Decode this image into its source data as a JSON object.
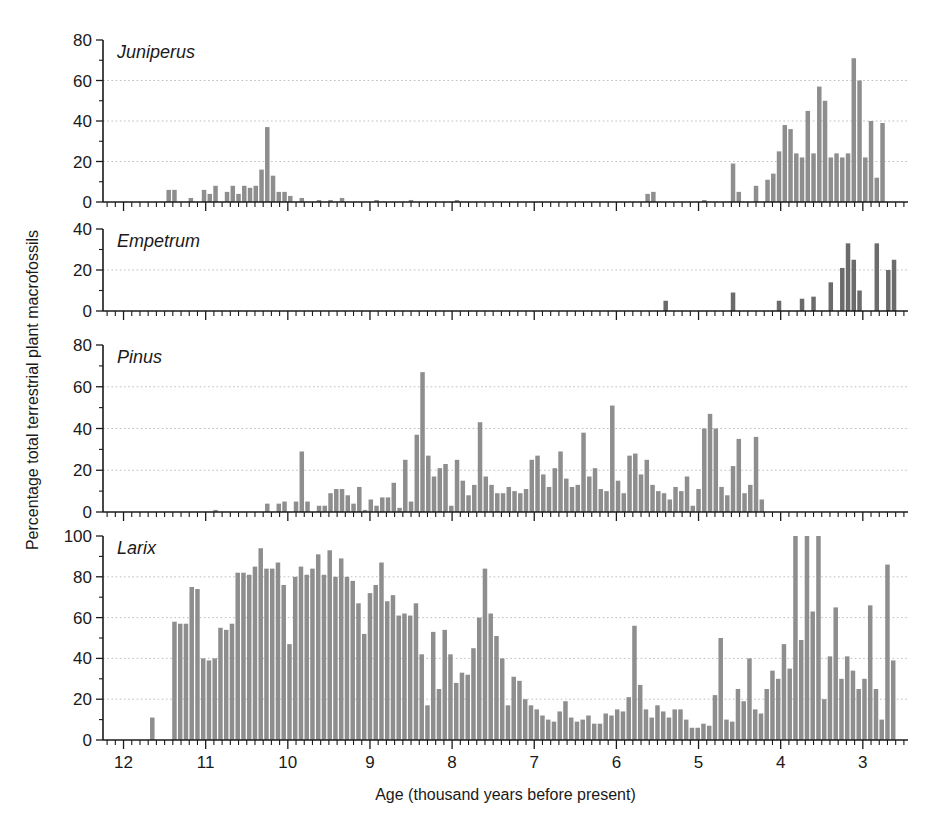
{
  "figure": {
    "xaxis_title": "Age (thousand years before present)",
    "yaxis_title": "Percentage total terrestrial plant macrofossils",
    "x_ticks": [
      "12",
      "11",
      "10",
      "9",
      "8",
      "7",
      "6",
      "5",
      "4",
      "3"
    ],
    "x_tick_values": [
      12,
      11,
      10,
      9,
      8,
      7,
      6,
      5,
      4,
      3
    ],
    "x_range": [
      12.25,
      2.45
    ],
    "bar_color": "#8e8e8e",
    "bar_color_dark": "#6b6b6b",
    "grid_color": "#b8b8b8",
    "axis_color": "#1a1a1a"
  },
  "chart_data": [
    {
      "type": "bar",
      "title": "Juniperus",
      "panel": 0,
      "xlabel": "Age (thousand years before present)",
      "ylabel": "Percentage total terrestrial plant macrofossils",
      "ylim": [
        0,
        80
      ],
      "y_ticks": [
        0,
        20,
        40,
        60,
        80
      ],
      "y_minor_step": 10,
      "xlim": [
        12.25,
        2.45
      ],
      "grid": true,
      "color": "#8e8e8e",
      "x": [
        11.45,
        11.38,
        11.31,
        11.18,
        11.02,
        10.95,
        10.88,
        10.74,
        10.67,
        10.6,
        10.53,
        10.46,
        10.39,
        10.32,
        10.25,
        10.18,
        10.11,
        10.04,
        9.97,
        9.9,
        9.83,
        9.76,
        9.69,
        9.62,
        9.55,
        9.48,
        9.41,
        9.34,
        9.2,
        9.06,
        8.92,
        8.78,
        8.5,
        8.22,
        7.94,
        5.62,
        5.55,
        5.0,
        4.93,
        4.58,
        4.51,
        4.37,
        4.3,
        4.16,
        4.09,
        4.02,
        3.95,
        3.88,
        3.81,
        3.74,
        3.67,
        3.6,
        3.53,
        3.46,
        3.39,
        3.32,
        3.25,
        3.18,
        3.11,
        3.04,
        2.97,
        2.9,
        2.83,
        2.76,
        2.69,
        2.62
      ],
      "values": [
        6,
        6,
        0,
        2,
        6,
        4,
        8,
        5,
        8,
        4,
        8,
        7,
        8,
        16,
        37,
        13,
        5,
        5,
        3,
        0,
        2,
        0,
        0,
        1,
        0,
        1,
        0,
        2,
        0,
        0,
        1,
        0,
        1,
        0,
        1,
        4,
        5,
        0,
        1,
        19,
        5,
        0,
        8,
        11,
        14,
        25,
        38,
        36,
        24,
        22,
        45,
        24,
        57,
        50,
        22,
        24,
        22,
        24,
        71,
        60,
        22,
        40,
        12,
        39,
        0,
        0
      ]
    },
    {
      "type": "bar",
      "title": "Empetrum",
      "panel": 1,
      "xlabel": "Age (thousand years before present)",
      "ylabel": "Percentage total terrestrial plant macrofossils",
      "ylim": [
        0,
        40
      ],
      "y_ticks": [
        0,
        20,
        40
      ],
      "y_minor_step": 10,
      "xlim": [
        12.25,
        2.45
      ],
      "grid": true,
      "color": "#6b6b6b",
      "x": [
        5.4,
        4.58,
        4.02,
        3.74,
        3.6,
        3.39,
        3.25,
        3.18,
        3.11,
        3.04,
        2.83,
        2.69,
        2.62
      ],
      "values": [
        5,
        9,
        5,
        6,
        7,
        14,
        21,
        33,
        25,
        10,
        33,
        20,
        25
      ]
    },
    {
      "type": "bar",
      "title": "Pinus",
      "panel": 2,
      "xlabel": "Age (thousand years before present)",
      "ylabel": "Percentage total terrestrial plant macrofossils",
      "ylim": [
        0,
        80
      ],
      "y_ticks": [
        0,
        20,
        40,
        60,
        80
      ],
      "y_minor_step": 10,
      "xlim": [
        12.25,
        2.45
      ],
      "grid": true,
      "color": "#8e8e8e",
      "x": [
        10.88,
        10.25,
        10.11,
        10.04,
        9.9,
        9.83,
        9.76,
        9.62,
        9.55,
        9.48,
        9.41,
        9.34,
        9.27,
        9.2,
        9.13,
        9.06,
        8.99,
        8.92,
        8.85,
        8.78,
        8.71,
        8.64,
        8.57,
        8.5,
        8.43,
        8.36,
        8.29,
        8.22,
        8.15,
        8.08,
        8.01,
        7.94,
        7.87,
        7.8,
        7.73,
        7.66,
        7.59,
        7.52,
        7.45,
        7.38,
        7.31,
        7.24,
        7.17,
        7.1,
        7.03,
        6.96,
        6.89,
        6.82,
        6.75,
        6.68,
        6.61,
        6.54,
        6.47,
        6.4,
        6.33,
        6.26,
        6.19,
        6.12,
        6.05,
        5.98,
        5.91,
        5.84,
        5.77,
        5.7,
        5.63,
        5.56,
        5.49,
        5.42,
        5.35,
        5.28,
        5.21,
        5.14,
        5.07,
        5.0,
        4.93,
        4.86,
        4.79,
        4.72,
        4.65,
        4.58,
        4.51,
        4.44,
        4.37,
        4.3,
        4.23,
        4.16,
        4.09,
        4.02,
        3.95,
        3.88,
        3.81,
        3.74,
        3.67
      ],
      "values": [
        1,
        4,
        4,
        5,
        5,
        29,
        5,
        3,
        3,
        9,
        11,
        11,
        8,
        4,
        12,
        1,
        6,
        3,
        7,
        7,
        14,
        2,
        25,
        5,
        37,
        67,
        27,
        17,
        21,
        23,
        3,
        25,
        15,
        8,
        13,
        43,
        17,
        13,
        9,
        9,
        12,
        10,
        9,
        11,
        25,
        27,
        18,
        12,
        21,
        29,
        16,
        12,
        13,
        38,
        17,
        21,
        11,
        10,
        51,
        15,
        9,
        27,
        28,
        18,
        25,
        13,
        10,
        9,
        6,
        12,
        10,
        17,
        3,
        11,
        40,
        47,
        40,
        12,
        8,
        22,
        35,
        9,
        13,
        36,
        6,
        0,
        0,
        0,
        0,
        0,
        0,
        0,
        0
      ]
    },
    {
      "type": "bar",
      "title": "Larix",
      "panel": 3,
      "xlabel": "Age (thousand years before present)",
      "ylabel": "Percentage total terrestrial plant macrofossils",
      "ylim": [
        0,
        100
      ],
      "y_ticks": [
        0,
        20,
        40,
        60,
        80,
        100
      ],
      "y_minor_step": 10,
      "xlim": [
        12.25,
        2.45
      ],
      "grid": true,
      "color": "#8e8e8e",
      "x": [
        11.65,
        11.38,
        11.31,
        11.24,
        11.17,
        11.1,
        11.03,
        10.96,
        10.89,
        10.82,
        10.75,
        10.68,
        10.61,
        10.54,
        10.47,
        10.4,
        10.33,
        10.26,
        10.19,
        10.12,
        10.05,
        9.98,
        9.91,
        9.84,
        9.77,
        9.7,
        9.63,
        9.56,
        9.49,
        9.42,
        9.35,
        9.28,
        9.21,
        9.14,
        9.07,
        9.0,
        8.93,
        8.86,
        8.79,
        8.72,
        8.65,
        8.58,
        8.51,
        8.44,
        8.37,
        8.3,
        8.23,
        8.16,
        8.09,
        8.02,
        7.95,
        7.88,
        7.81,
        7.74,
        7.67,
        7.6,
        7.53,
        7.46,
        7.39,
        7.32,
        7.25,
        7.18,
        7.11,
        7.04,
        6.97,
        6.9,
        6.83,
        6.76,
        6.69,
        6.62,
        6.55,
        6.48,
        6.41,
        6.34,
        6.27,
        6.2,
        6.13,
        6.06,
        5.99,
        5.92,
        5.85,
        5.78,
        5.71,
        5.64,
        5.57,
        5.5,
        5.43,
        5.36,
        5.29,
        5.22,
        5.15,
        5.08,
        5.01,
        4.94,
        4.87,
        4.8,
        4.73,
        4.66,
        4.59,
        4.52,
        4.45,
        4.38,
        4.31,
        4.24,
        4.17,
        4.1,
        4.03,
        3.96,
        3.89,
        3.82,
        3.75,
        3.68,
        3.61,
        3.54,
        3.47,
        3.4,
        3.33,
        3.26,
        3.19,
        3.12,
        3.05,
        2.98,
        2.91,
        2.84,
        2.77,
        2.7,
        2.63
      ],
      "values": [
        11,
        58,
        57,
        57,
        75,
        74,
        40,
        39,
        40,
        55,
        54,
        57,
        82,
        82,
        81,
        85,
        94,
        84,
        84,
        87,
        76,
        47,
        80,
        85,
        81,
        84,
        91,
        81,
        93,
        80,
        89,
        80,
        78,
        67,
        52,
        72,
        76,
        87,
        68,
        71,
        61,
        62,
        61,
        67,
        42,
        17,
        53,
        25,
        54,
        42,
        28,
        33,
        32,
        45,
        60,
        84,
        62,
        51,
        40,
        17,
        31,
        29,
        20,
        17,
        15,
        12,
        10,
        9,
        14,
        19,
        11,
        9,
        10,
        12,
        8,
        8,
        13,
        12,
        15,
        14,
        21,
        56,
        27,
        15,
        11,
        17,
        14,
        11,
        15,
        15,
        10,
        6,
        6,
        8,
        7,
        22,
        50,
        10,
        9,
        25,
        19,
        40,
        15,
        13,
        25,
        34,
        30,
        47,
        35,
        100,
        49,
        100,
        63,
        100,
        20,
        41,
        65,
        30,
        41,
        34,
        25,
        30,
        66,
        25,
        10,
        86,
        39
      ]
    }
  ]
}
